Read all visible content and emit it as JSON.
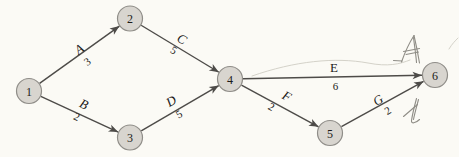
{
  "figure": {
    "type": "activity-network-diagram",
    "colors": {
      "background": "#fbfaf5",
      "node_fill": "#d8d5cf",
      "node_stroke": "#8f8d88",
      "edge": "#4d4b48",
      "label": "#1c1b19",
      "pencil": "#8f8d86",
      "faint": "#d4d2c9"
    },
    "node_radius": 12.5,
    "nodes": [
      {
        "id": "1",
        "x": 29,
        "y": 91
      },
      {
        "id": "2",
        "x": 130,
        "y": 18.5
      },
      {
        "id": "3",
        "x": 130,
        "y": 137.5
      },
      {
        "id": "4",
        "x": 230,
        "y": 79
      },
      {
        "id": "5",
        "x": 330,
        "y": 133
      },
      {
        "id": "6",
        "x": 435,
        "y": 75
      }
    ],
    "edges": [
      {
        "name": "A",
        "value": "3",
        "from": "1",
        "to": "2",
        "upright": false,
        "label": {
          "x": 79,
          "y": 49,
          "rot": -36
        },
        "value_pos": {
          "x": 87,
          "y": 61.5,
          "rot": -36
        }
      },
      {
        "name": "B",
        "value": "2",
        "from": "1",
        "to": "3",
        "upright": false,
        "label": {
          "x": 84,
          "y": 104,
          "rot": 25
        },
        "value_pos": {
          "x": 77,
          "y": 116.5,
          "rot": 25
        }
      },
      {
        "name": "C",
        "value": "5",
        "from": "2",
        "to": "4",
        "upright": false,
        "label": {
          "x": 182,
          "y": 39,
          "rot": 31
        },
        "value_pos": {
          "x": 174,
          "y": 50,
          "rot": 31
        }
      },
      {
        "name": "D",
        "value": "5",
        "from": "3",
        "to": "4",
        "upright": false,
        "label": {
          "x": 171,
          "y": 101,
          "rot": -30
        },
        "value_pos": {
          "x": 179,
          "y": 114,
          "rot": -30
        }
      },
      {
        "name": "E",
        "value": "6",
        "from": "4",
        "to": "6",
        "upright": true,
        "label": {
          "x": 334,
          "y": 67.5,
          "rot": 0
        },
        "value_pos": {
          "x": 335.5,
          "y": 86,
          "rot": 0
        }
      },
      {
        "name": "F",
        "value": "2",
        "from": "4",
        "to": "5",
        "upright": false,
        "label": {
          "x": 287,
          "y": 96,
          "rot": 29
        },
        "value_pos": {
          "x": 271.5,
          "y": 106.5,
          "rot": 29
        }
      },
      {
        "name": "G",
        "value": "2",
        "from": "5",
        "to": "6",
        "upright": false,
        "label": {
          "x": 378,
          "y": 100,
          "rot": -31
        },
        "value_pos": {
          "x": 387.5,
          "y": 110.5,
          "rot": -31
        }
      }
    ],
    "pencil_marks": [
      {
        "name": "handwritten-mark-top",
        "paths": [
          "M393.5 60.5 L402 61",
          "M401.5 62 C405 52 409.5 42.5 414 35.5",
          "M414 35.5 C416 44 418 54 419.5 63",
          "M413.5 37.5 C414.5 46 416 55 416.5 62.5",
          "M403.5 51.5 L419.5 48.5",
          "M406 54.5 L418.5 52"
        ]
      },
      {
        "name": "handwritten-mark-bottom",
        "paths": [
          "M416.5 98.5 C414.5 106 412.5 114 411.5 120.5 C411 124 415.5 123.5 419.5 119.5",
          "M418.5 99.5 C416.5 107 414.5 114 413.5 119.5",
          "M403.5 116.5 L417.5 104.5"
        ]
      }
    ],
    "stray_marks": [
      {
        "name": "faint-arc",
        "path": "M252 76 C 295 61 335 57 368 63 C 388 67 400 64 410 60"
      },
      {
        "name": "corner-smudge",
        "path": "M449 49 C452 44 455 41 458 38"
      }
    ]
  }
}
